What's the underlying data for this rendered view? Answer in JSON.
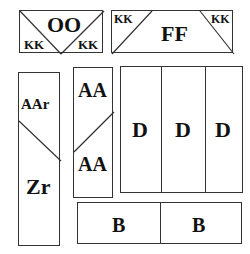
{
  "diagram": {
    "panels": [
      {
        "id": "oo",
        "main_label": "OO",
        "corner_labels": [
          "KK",
          "KK"
        ]
      },
      {
        "id": "ff",
        "main_label": "FF",
        "corner_labels": [
          "KK",
          "KK"
        ]
      },
      {
        "id": "aar-zr",
        "top_label": "AAr",
        "bottom_label": "Zr"
      },
      {
        "id": "aa",
        "top_label": "AA",
        "bottom_label": "AA"
      },
      {
        "id": "d-group",
        "cells": [
          "D",
          "D",
          "D"
        ]
      },
      {
        "id": "b-group",
        "cells": [
          "B",
          "B"
        ]
      }
    ],
    "line_color": "#333333",
    "background": "#ffffff"
  }
}
